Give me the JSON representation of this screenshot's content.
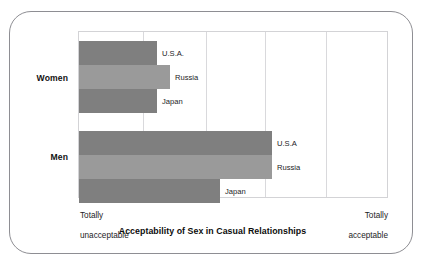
{
  "chart_data": {
    "type": "bar",
    "orientation": "horizontal",
    "title": "Acceptability of Sex in Casual Relationships",
    "xlabel": "",
    "ylabel": "",
    "grid": true,
    "gridlines": 6,
    "legend": "none",
    "axis_scale_labels": {
      "left": "Totally\nunacceptable",
      "right": "Totally\nacceptable"
    },
    "xlim": [
      0,
      5
    ],
    "groups": [
      {
        "name": "Women",
        "bars": [
          {
            "label": "U.S.A.",
            "value": 1.27,
            "color": "#7f7f7f"
          },
          {
            "label": "Russia",
            "value": 1.48,
            "color": "#9a9a9a"
          },
          {
            "label": "Japan",
            "value": 1.27,
            "color": "#7f7f7f"
          }
        ]
      },
      {
        "name": "Men",
        "bars": [
          {
            "label": "U.S.A",
            "value": 3.13,
            "color": "#7f7f7f"
          },
          {
            "label": "Russia",
            "value": 3.13,
            "color": "#9a9a9a"
          },
          {
            "label": "Japan",
            "value": 2.29,
            "color": "#7f7f7f"
          }
        ]
      }
    ]
  },
  "figure": {
    "group_women": "Women",
    "group_men": "Men",
    "title": "Acceptability of Sex in Casual Relationships",
    "axis_left_line1": "Totally",
    "axis_left_line2": "unacceptable",
    "axis_right_line1": "Totally",
    "axis_right_line2": "acceptable",
    "women_usa": "U.S.A.",
    "women_russia": "Russia",
    "women_japan": "Japan",
    "men_usa": "U.S.A",
    "men_russia": "Russia",
    "men_japan": "Japan",
    "colors": {
      "bar_dark": "#7f7f7f",
      "bar_light": "#9a9a9a",
      "gridline": "#d9d9dc",
      "frame": "#8e8e93",
      "text": "#1c1c1e",
      "background": "#ffffff"
    }
  }
}
